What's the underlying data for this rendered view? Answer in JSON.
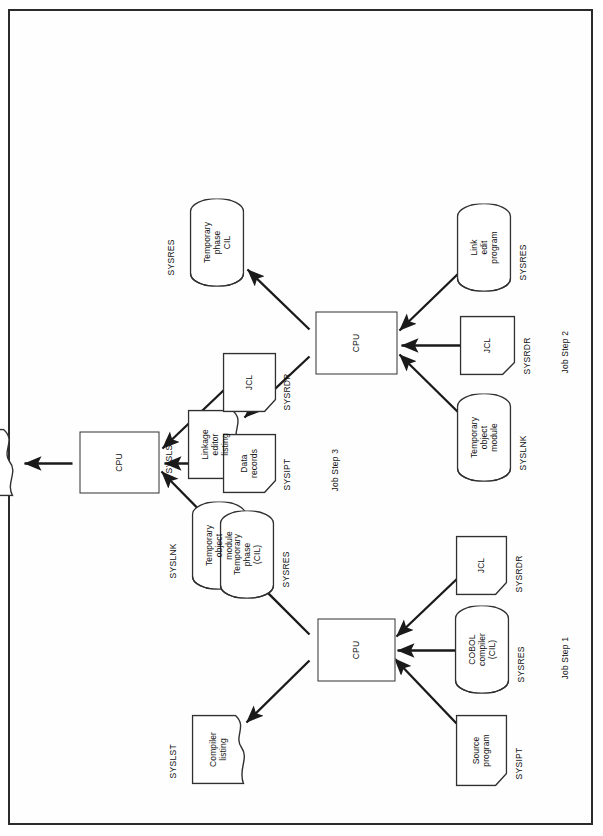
{
  "page": {
    "border_color": "#2b2b2b",
    "background": "#ffffff",
    "stroke_color": "#303030",
    "text_color": "#111111",
    "orientation": "rotated-90-ccw"
  },
  "steps": [
    {
      "id": "step1",
      "label": "Job Step 1"
    },
    {
      "id": "step2",
      "label": "Job Step 2"
    },
    {
      "id": "step3",
      "label": "Job Step 3"
    }
  ],
  "processors": [
    {
      "id": "cpu1",
      "label": "CPU"
    },
    {
      "id": "cpu2",
      "label": "CPU"
    },
    {
      "id": "cpu3",
      "label": "CPU"
    }
  ],
  "nodes": {
    "step1": {
      "inputs": [
        {
          "id": "source-program",
          "shape": "punched-card",
          "label": "Source\nprogram",
          "device": "SYSIPT"
        },
        {
          "id": "cobol-compiler",
          "shape": "disk",
          "label": "COBOL\ncompiler\n(CIL)",
          "device": "SYSRES"
        },
        {
          "id": "jcl-1",
          "shape": "punched-card",
          "label": "JCL",
          "device": "SYSRDR"
        }
      ],
      "outputs": [
        {
          "id": "compiler-listing",
          "shape": "document",
          "label": "Compiler\nlisting",
          "device": "SYSLST"
        },
        {
          "id": "temp-object-module-out",
          "shape": "disk",
          "label": "Temporary\nobject\nmodule",
          "device": "SYSLNK"
        }
      ]
    },
    "step2": {
      "inputs": [
        {
          "id": "temp-object-module-in",
          "shape": "disk",
          "label": "Temporary\nobject\nmodule",
          "device": "SYSLNK"
        },
        {
          "id": "jcl-2",
          "shape": "punched-card",
          "label": "JCL",
          "device": "SYSRDR"
        },
        {
          "id": "link-edit-program",
          "shape": "disk",
          "label": "Link\nedit\nprogram",
          "device": "SYSRES"
        }
      ],
      "outputs": [
        {
          "id": "linkage-editor-listing",
          "shape": "document",
          "label": "Linkage\neditor\nlisting",
          "device": "SYSLST"
        },
        {
          "id": "temporary-phase-cil-out",
          "shape": "disk",
          "label": "Temporary\nphase\nCIL",
          "device": "SYSRES"
        }
      ]
    },
    "step3": {
      "inputs": [
        {
          "id": "temporary-phase-cil-in",
          "shape": "disk",
          "label": "Temporary\nphase\n(CIL)",
          "device": "SYSRES"
        },
        {
          "id": "data-records",
          "shape": "punched-card",
          "label": "Data\nrecords",
          "device": "SYSIPT"
        },
        {
          "id": "jcl-3",
          "shape": "punched-card",
          "label": "JCL",
          "device": "SYSRDR"
        }
      ],
      "outputs": [
        {
          "id": "report",
          "shape": "document",
          "label": "Report",
          "device": "SYSLST"
        }
      ]
    }
  }
}
